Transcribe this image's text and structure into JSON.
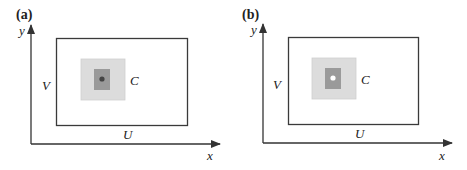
{
  "panels": [
    {
      "id": "a",
      "label": "(a)",
      "axis_x": "x",
      "axis_y": "y",
      "outer_rect_width_label": "U",
      "outer_rect_height_label": "V",
      "inner_label": "C",
      "center_marker": "dark-dot"
    },
    {
      "id": "b",
      "label": "(b)",
      "axis_x": "x",
      "axis_y": "y",
      "outer_rect_width_label": "U",
      "outer_rect_height_label": "V",
      "inner_label": "C",
      "center_marker": "white-dot"
    }
  ],
  "colors": {
    "line": "#3a3a3a",
    "outer_square": "#dcdcdc",
    "inner_square": "#9a9a9a",
    "dot_a": "#444444",
    "dot_b": "#ffffff"
  }
}
